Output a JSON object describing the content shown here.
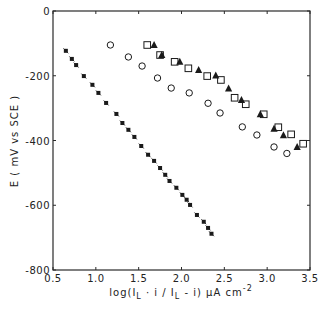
{
  "chart_data": {
    "type": "scatter",
    "title": "",
    "xlabel": "log(I_L · i / I_L - i) μA cm⁻²",
    "ylabel": "E ( mV vs SCE )",
    "xlim": [
      0.5,
      3.5
    ],
    "ylim": [
      -800,
      0
    ],
    "x_ticks": [
      0.5,
      1.0,
      1.5,
      2.0,
      2.5,
      3.0,
      3.5
    ],
    "x_tick_labels": [
      "0.5",
      "1.0",
      "1.5",
      "2.0",
      "2.5",
      "3.0",
      "3.5"
    ],
    "y_ticks": [
      0,
      -200,
      -400,
      -600,
      -800
    ],
    "y_tick_labels": [
      "0",
      "-200",
      "-400",
      "-600",
      "-800"
    ],
    "grid": false,
    "legend": null,
    "series": [
      {
        "name": "asterisk",
        "marker": "star",
        "points": [
          [
            0.65,
            -123
          ],
          [
            0.72,
            -148
          ],
          [
            0.77,
            -167
          ],
          [
            0.86,
            -201
          ],
          [
            0.96,
            -228
          ],
          [
            1.03,
            -253
          ],
          [
            1.12,
            -284
          ],
          [
            1.24,
            -318
          ],
          [
            1.31,
            -346
          ],
          [
            1.38,
            -367
          ],
          [
            1.45,
            -389
          ],
          [
            1.53,
            -417
          ],
          [
            1.61,
            -444
          ],
          [
            1.68,
            -463
          ],
          [
            1.75,
            -485
          ],
          [
            1.81,
            -506
          ],
          [
            1.86,
            -525
          ],
          [
            1.94,
            -546
          ],
          [
            2.01,
            -568
          ],
          [
            2.06,
            -583
          ],
          [
            2.1,
            -599
          ],
          [
            2.18,
            -630
          ],
          [
            2.26,
            -651
          ],
          [
            2.31,
            -670
          ],
          [
            2.35,
            -688
          ]
        ]
      },
      {
        "name": "circle",
        "marker": "open-circle",
        "points": [
          [
            1.17,
            -105
          ],
          [
            1.38,
            -142
          ],
          [
            1.54,
            -170
          ],
          [
            1.72,
            -207
          ],
          [
            1.88,
            -238
          ],
          [
            2.09,
            -253
          ],
          [
            2.31,
            -285
          ],
          [
            2.45,
            -315
          ],
          [
            2.71,
            -358
          ],
          [
            2.88,
            -383
          ],
          [
            3.08,
            -420
          ],
          [
            3.23,
            -440
          ]
        ]
      },
      {
        "name": "square",
        "marker": "open-square",
        "points": [
          [
            1.6,
            -105
          ],
          [
            1.75,
            -136
          ],
          [
            1.92,
            -157
          ],
          [
            2.08,
            -177
          ],
          [
            2.3,
            -201
          ],
          [
            2.46,
            -213
          ],
          [
            2.62,
            -268
          ],
          [
            2.75,
            -288
          ],
          [
            2.96,
            -319
          ],
          [
            3.13,
            -359
          ],
          [
            3.28,
            -381
          ],
          [
            3.42,
            -410
          ]
        ]
      },
      {
        "name": "triangle",
        "marker": "filled-triangle",
        "points": [
          [
            1.68,
            -105
          ],
          [
            1.77,
            -136
          ],
          [
            1.98,
            -157
          ],
          [
            2.2,
            -182
          ],
          [
            2.4,
            -199
          ],
          [
            2.55,
            -239
          ],
          [
            2.7,
            -275
          ],
          [
            2.92,
            -319
          ],
          [
            3.08,
            -364
          ],
          [
            3.19,
            -384
          ],
          [
            3.35,
            -420
          ]
        ]
      }
    ]
  }
}
